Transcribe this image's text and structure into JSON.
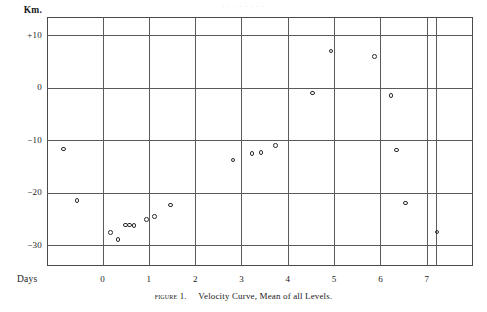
{
  "page": {
    "bleed_text": "· ·  ·   ·    ·     ·      ·       ·",
    "caption_figure_number": "Figure 1.",
    "caption_text": "Velocity Curve, Mean of all Levels."
  },
  "chart_data": {
    "type": "scatter",
    "title": "Velocity Curve, Mean of all Levels.",
    "xlabel": "Days",
    "ylabel": "Km.",
    "xlim": [
      -1.2,
      8.0
    ],
    "ylim": [
      -34.0,
      13.5
    ],
    "grid": true,
    "legend": null,
    "xticks": [
      0,
      1,
      2,
      3,
      4,
      5,
      6,
      7
    ],
    "xtick_labels": [
      "0",
      "1",
      "2",
      "3",
      "4",
      "5",
      "6",
      "7"
    ],
    "yticks": [
      10,
      0,
      -10,
      -20,
      -30
    ],
    "ytick_labels": [
      "+10",
      "0",
      "−10",
      "−20",
      "−30"
    ],
    "extra_vertical_rule_at": 7.2,
    "marker": "open-circle",
    "points": [
      {
        "x": -0.85,
        "y": -11.7
      },
      {
        "x": -0.55,
        "y": -21.5
      },
      {
        "x": 0.17,
        "y": -27.6
      },
      {
        "x": 0.33,
        "y": -29.0
      },
      {
        "x": 0.49,
        "y": -26.2
      },
      {
        "x": 0.58,
        "y": -26.2
      },
      {
        "x": 0.68,
        "y": -26.3
      },
      {
        "x": 0.95,
        "y": -25.1
      },
      {
        "x": 1.12,
        "y": -24.6
      },
      {
        "x": 1.47,
        "y": -22.4
      },
      {
        "x": 2.82,
        "y": -13.8
      },
      {
        "x": 3.23,
        "y": -12.5
      },
      {
        "x": 3.42,
        "y": -12.3
      },
      {
        "x": 3.73,
        "y": -11.0
      },
      {
        "x": 4.53,
        "y": -1.0
      },
      {
        "x": 4.93,
        "y": 7.0
      },
      {
        "x": 5.87,
        "y": 6.0
      },
      {
        "x": 6.23,
        "y": -1.5
      },
      {
        "x": 6.35,
        "y": -11.9
      },
      {
        "x": 6.54,
        "y": -22.0
      },
      {
        "x": 7.22,
        "y": -27.5
      }
    ]
  }
}
